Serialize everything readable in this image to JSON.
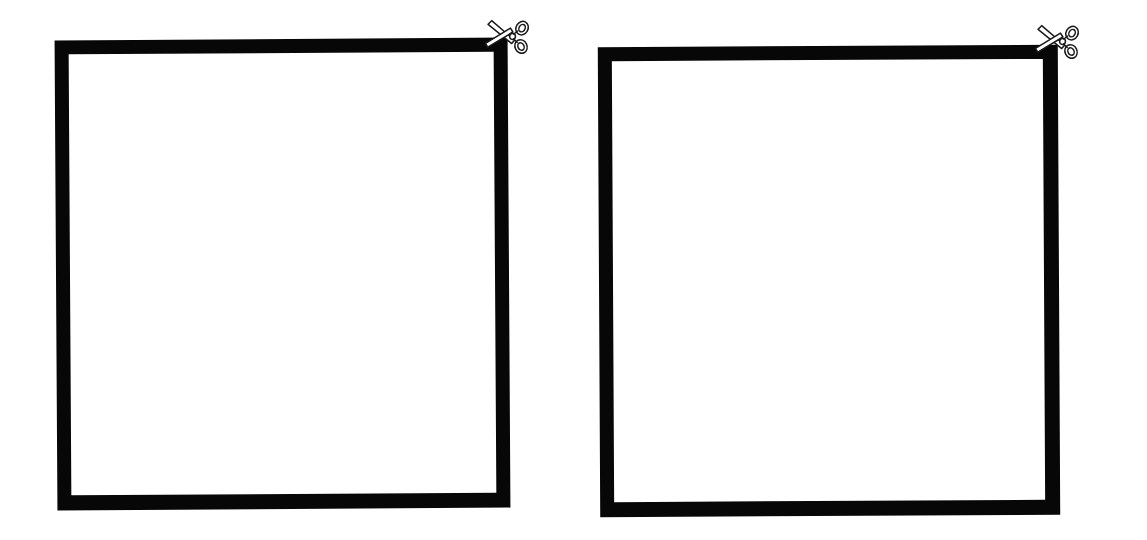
{
  "page": {
    "background_color": "#ffffff",
    "width": 1147,
    "height": 540
  },
  "style": {
    "border_color": "#070707",
    "fill_color": "#ffffff",
    "scissors_outline_color": "#1a1a1a",
    "scissors_fill_color": "#ffffff"
  },
  "coupons": [
    {
      "id": "coupon-1",
      "name": "left-coupon",
      "content": "",
      "border_width_px": 14,
      "position": {
        "x": 56,
        "y": 39,
        "width": 453,
        "height": 470
      },
      "cut_marker": {
        "icon": "scissors-icon",
        "position": "top-right",
        "label": ""
      }
    },
    {
      "id": "coupon-2",
      "name": "right-coupon",
      "content": "",
      "border_width_px": 14,
      "position": {
        "x": 599,
        "y": 46,
        "width": 460,
        "height": 470
      },
      "cut_marker": {
        "icon": "scissors-icon",
        "position": "top-right",
        "label": ""
      }
    }
  ]
}
